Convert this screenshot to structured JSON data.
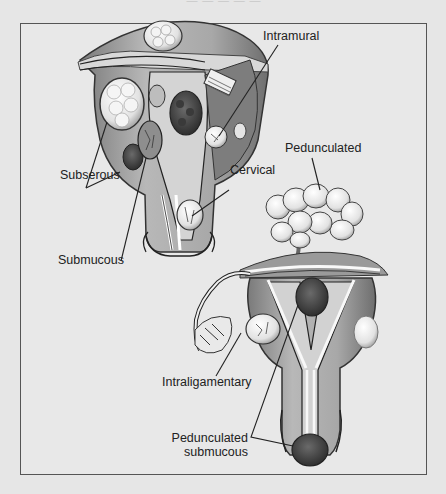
{
  "figure": {
    "header_partial": "— — — — —"
  },
  "labels": {
    "intramural": "Intramural",
    "subserous": "Subserous",
    "cervical": "Cervical",
    "submucous": "Submucous",
    "pedunculated": "Pedunculated",
    "intraligamentary": "Intraligamentary",
    "pedunculated_submucous_line1": "Pedunculated",
    "pedunculated_submucous_line2": "submucous"
  },
  "colors": {
    "background": "#e6e6e6",
    "frame_border": "#555555",
    "tissue_light": "#c9c9c9",
    "tissue_mid": "#9a9a9a",
    "tissue_dark": "#4a4a4a",
    "fibroid_light": "#f2f2f2",
    "leader_line": "#222222"
  }
}
